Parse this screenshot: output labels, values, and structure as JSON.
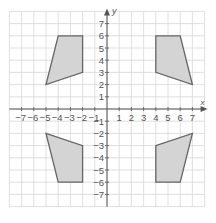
{
  "chart_data": {
    "type": "scatter",
    "title": "",
    "xlabel": "x",
    "ylabel": "y",
    "xlim": [
      -8,
      8
    ],
    "ylim": [
      -8,
      8
    ],
    "grid": true,
    "x_ticks": [
      "-7",
      "-6",
      "-5",
      "-4",
      "-3",
      "-2",
      "-1",
      "1",
      "2",
      "3",
      "4",
      "5",
      "6",
      "7"
    ],
    "y_ticks": [
      "7",
      "6",
      "5",
      "4",
      "3",
      "2",
      "1",
      "-1",
      "-2",
      "-3",
      "-4",
      "-5",
      "-6",
      "-7"
    ],
    "shapes": [
      {
        "name": "quadrilateral-Q2",
        "vertices": [
          [
            -4,
            6
          ],
          [
            -2,
            6
          ],
          [
            -2,
            3
          ],
          [
            -5,
            2
          ]
        ]
      },
      {
        "name": "quadrilateral-Q1",
        "vertices": [
          [
            4,
            6
          ],
          [
            6,
            6
          ],
          [
            7,
            2
          ],
          [
            4,
            3
          ]
        ]
      },
      {
        "name": "quadrilateral-Q3",
        "vertices": [
          [
            -5,
            -2
          ],
          [
            -2,
            -3
          ],
          [
            -2,
            -6
          ],
          [
            -4,
            -6
          ]
        ]
      },
      {
        "name": "quadrilateral-Q4",
        "vertices": [
          [
            4,
            -3
          ],
          [
            7,
            -2
          ],
          [
            6,
            -6
          ],
          [
            4,
            -6
          ]
        ]
      }
    ],
    "colors": {
      "fill": "#d4d4d4",
      "stroke": "#666666",
      "grid": "#d8d8d8",
      "axis": "#555555"
    }
  }
}
